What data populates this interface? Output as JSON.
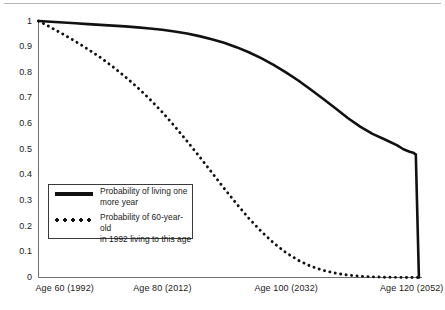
{
  "figure": {
    "name": "survival-probability-chart",
    "top_rule": true,
    "background_color": "#ffffff",
    "line_color": "#111111"
  },
  "chart_data": {
    "type": "line",
    "title": "",
    "subtitle": "",
    "xlabel": "",
    "ylabel": "",
    "xlim": [
      60,
      122
    ],
    "ylim": [
      0,
      1
    ],
    "grid": false,
    "legend_position": "center-left",
    "x_tick_values": [
      60,
      80,
      100,
      120
    ],
    "x_tick_labels": [
      "Age 60 (1992)",
      "Age 80 (2012)",
      "Age 100 (2032)",
      "Age 120 (2052)"
    ],
    "y_tick_values": [
      0,
      0.1,
      0.2,
      0.3,
      0.4,
      0.5,
      0.6,
      0.7,
      0.8,
      0.9,
      1
    ],
    "y_tick_labels": [
      "0",
      "0.1",
      "0.2",
      "0.3",
      "0.4",
      "0.5",
      "0.6",
      "0.7",
      "0.8",
      "0.9",
      "1"
    ],
    "series": [
      {
        "name": "Probability of living one more year",
        "legend_label": "Probability of living one\nmore year",
        "style": "solid",
        "color": "#111111",
        "x": [
          60,
          62,
          64,
          66,
          68,
          70,
          72,
          74,
          76,
          78,
          80,
          82,
          84,
          86,
          88,
          90,
          92,
          94,
          96,
          98,
          100,
          102,
          104,
          106,
          108,
          110,
          112,
          114,
          116,
          118,
          119,
          120,
          120.6,
          121,
          121.5
        ],
        "values": [
          1.0,
          0.997,
          0.994,
          0.991,
          0.988,
          0.985,
          0.982,
          0.979,
          0.975,
          0.971,
          0.966,
          0.959,
          0.951,
          0.941,
          0.929,
          0.915,
          0.898,
          0.878,
          0.855,
          0.829,
          0.8,
          0.768,
          0.733,
          0.697,
          0.66,
          0.622,
          0.588,
          0.56,
          0.538,
          0.515,
          0.5,
          0.49,
          0.486,
          0.48,
          0.0
        ]
      },
      {
        "name": "Probability of 60-year-old in 1992 living to this age",
        "legend_label": "Probability of 60-year-old\nin 1992 living to this age",
        "style": "dotted",
        "color": "#111111",
        "x": [
          60,
          62,
          64,
          66,
          68,
          70,
          72,
          74,
          76,
          78,
          80,
          82,
          84,
          86,
          88,
          90,
          92,
          94,
          96,
          98,
          100,
          102,
          104,
          106,
          108,
          110,
          112,
          114,
          116,
          118,
          120,
          121.5
        ],
        "values": [
          1.0,
          0.975,
          0.948,
          0.92,
          0.89,
          0.858,
          0.822,
          0.783,
          0.741,
          0.695,
          0.645,
          0.59,
          0.532,
          0.472,
          0.41,
          0.348,
          0.288,
          0.231,
          0.18,
          0.135,
          0.097,
          0.067,
          0.044,
          0.028,
          0.017,
          0.0095,
          0.005,
          0.0025,
          0.0012,
          0.0005,
          0.0002,
          0.0
        ]
      }
    ]
  },
  "legend": {
    "entries": [
      {
        "marker": "solid-line-icon",
        "label": "Probability of living one\nmore year"
      },
      {
        "marker": "dotted-line-icon",
        "label": "Probability of 60-year-old\nin 1992 living to this age"
      }
    ]
  }
}
